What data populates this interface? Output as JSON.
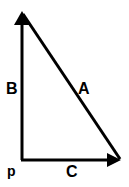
{
  "diagram": {
    "type": "vector-right-triangle",
    "colors": {
      "stroke": "#000000",
      "background": "#ffffff"
    },
    "labels": {
      "a": "A",
      "b": "B",
      "c": "C",
      "p": "p"
    },
    "vectors": [
      {
        "name": "B",
        "from": "p",
        "direction": "up"
      },
      {
        "name": "C",
        "from": "p",
        "direction": "right"
      },
      {
        "name": "A",
        "from": "top of B",
        "to": "tip of C"
      }
    ]
  }
}
